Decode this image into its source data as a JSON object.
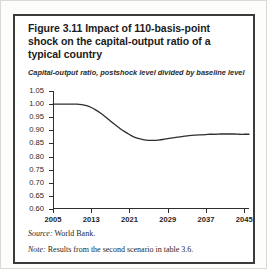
{
  "figure": {
    "title": "Figure 3.11  Impact of 110-basis-point shock on the capital-output ratio of a typical country",
    "subtitle": "Capital-output ratio, postshock level divided by baseline level",
    "source_label": "Source:",
    "source_text": "World Bank.",
    "note_label": "Note:",
    "note_text": "Results from the second scenario in table 3.6.",
    "line_color": "#2e2e2e",
    "border_color": "#3a3a3a"
  },
  "chart_data": {
    "type": "line",
    "title": "Figure 3.11  Impact of 110-basis-point shock on the capital-output ratio of a typical country",
    "subtitle": "Capital-output ratio, postshock level divided by baseline level",
    "xlabel": "",
    "ylabel": "Capital-output ratio, postshock level divided by baseline level",
    "xlim": [
      2005,
      2046
    ],
    "ylim": [
      0.6,
      1.05
    ],
    "grid": false,
    "legend": false,
    "ytick_labels": [
      "1.05",
      "1.00",
      "0.95",
      "0.90",
      "0.85",
      "0.80",
      "0.75",
      "0.70",
      "0.65",
      "0.60"
    ],
    "ytick_values": [
      1.05,
      1.0,
      0.95,
      0.9,
      0.85,
      0.8,
      0.75,
      0.7,
      0.65,
      0.6
    ],
    "xtick_labels": [
      "2005",
      "2013",
      "2021",
      "2029",
      "2037",
      "2045"
    ],
    "xtick_values": [
      2005,
      2013,
      2021,
      2029,
      2037,
      2045
    ],
    "series": [
      {
        "name": "Capital-output ratio (postshock / baseline)",
        "x": [
          2005,
          2006,
          2007,
          2008,
          2009,
          2010,
          2011,
          2012,
          2013,
          2014,
          2015,
          2016,
          2017,
          2018,
          2019,
          2020,
          2021,
          2022,
          2023,
          2024,
          2025,
          2026,
          2027,
          2028,
          2029,
          2030,
          2031,
          2032,
          2033,
          2034,
          2035,
          2036,
          2037,
          2038,
          2039,
          2040,
          2041,
          2042,
          2043,
          2044,
          2045,
          2046
        ],
        "values": [
          1.0,
          1.0,
          1.0,
          1.0,
          1.0,
          1.0,
          0.998,
          0.994,
          0.987,
          0.977,
          0.965,
          0.951,
          0.936,
          0.921,
          0.907,
          0.895,
          0.884,
          0.874,
          0.868,
          0.864,
          0.862,
          0.862,
          0.863,
          0.865,
          0.868,
          0.871,
          0.874,
          0.876,
          0.879,
          0.881,
          0.882,
          0.883,
          0.884,
          0.885,
          0.885,
          0.886,
          0.886,
          0.886,
          0.886,
          0.885,
          0.885,
          0.885
        ]
      }
    ],
    "annotations": {
      "initial_level": 1.0,
      "trough_value": 0.862,
      "trough_year": 2025,
      "final_level": 0.885
    }
  }
}
